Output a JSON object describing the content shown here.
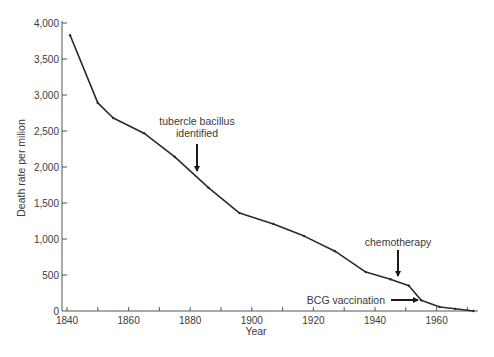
{
  "chart_data": {
    "type": "line",
    "title": "",
    "xlabel": "Year",
    "ylabel": "Death rate per milion",
    "xlim": [
      1838,
      1972
    ],
    "ylim": [
      0,
      4000
    ],
    "grid": false,
    "legend": null,
    "x_ticks": [
      1840,
      1850,
      1860,
      1870,
      1880,
      1890,
      1900,
      1910,
      1920,
      1930,
      1940,
      1950,
      1960,
      1970
    ],
    "x_tick_labels": [
      "1840",
      "1860",
      "1880",
      "1900",
      "1920",
      "1940",
      "1960"
    ],
    "y_ticks": [
      0,
      500,
      1000,
      1500,
      2000,
      2500,
      3000,
      3500,
      4000
    ],
    "y_tick_labels": [
      "0",
      "500",
      "1,000",
      "1,500",
      "2,000",
      "2,500",
      "3,000",
      "3,500",
      "4,000"
    ],
    "series": [
      {
        "name": "Tuberculosis death rate",
        "x": [
          1841,
          1850,
          1855,
          1865,
          1875,
          1886,
          1896,
          1907,
          1917,
          1927,
          1937,
          1945,
          1951,
          1955,
          1961,
          1966,
          1972
        ],
        "values": [
          3830,
          2890,
          2680,
          2470,
          2140,
          1710,
          1360,
          1210,
          1040,
          830,
          540,
          440,
          350,
          150,
          55,
          30,
          0
        ]
      }
    ],
    "annotations": [
      {
        "text": [
          "tubercle bacillus",
          "identified"
        ],
        "x": 1882,
        "arrow": "down",
        "points_to_value": 1870
      },
      {
        "text": [
          "chemotherapy"
        ],
        "x": 1947,
        "arrow": "down",
        "points_to_value": 400
      },
      {
        "text": [
          "BCG vaccination"
        ],
        "x": 1954,
        "arrow": "right",
        "points_to_value": 180
      }
    ]
  }
}
